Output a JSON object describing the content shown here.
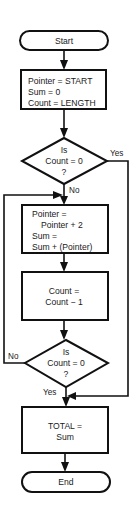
{
  "flowchart": {
    "start": {
      "label": "Start"
    },
    "init": {
      "lines": [
        "Pointer = START",
        "Sum = 0",
        "Count = LENGTH"
      ]
    },
    "decision1": {
      "lines": [
        "Is",
        "Count = 0",
        "?"
      ],
      "yes_label": "Yes",
      "no_label": "No"
    },
    "loop_body": {
      "lines": [
        "Pointer =",
        "Pointer + 2",
        "Sum =",
        "Sum + (Pointer)"
      ]
    },
    "decrement": {
      "lines": [
        "Count =",
        "Count − 1"
      ]
    },
    "decision2": {
      "lines": [
        "Is",
        "Count = 0",
        "?"
      ],
      "yes_label": "Yes",
      "no_label": "No"
    },
    "total": {
      "lines": [
        "TOTAL =",
        "Sum"
      ]
    },
    "end": {
      "label": "End"
    }
  },
  "colors": {
    "stroke": "#111111",
    "background": "#ffffff",
    "text": "#1a1a1a"
  }
}
